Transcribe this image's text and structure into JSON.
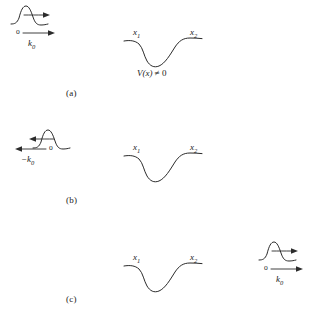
{
  "figure": {
    "background_color": "#ffffff",
    "ink_color": "#2b2b2b",
    "panels": [
      {
        "id": "a",
        "label": "(a)",
        "packet": {
          "name": "wave-packet-incoming",
          "direction": "right",
          "origin_label": "o",
          "momentum_label": "k",
          "momentum_sub": "0"
        },
        "well": {
          "name": "potential-well",
          "left_label": "x",
          "left_sub": "1",
          "right_label": "x",
          "right_sub": "2",
          "caption": "V(x) ≠ 0",
          "caption_fn": "V",
          "caption_arg": "(x)",
          "caption_rel": "≠ 0"
        }
      },
      {
        "id": "b",
        "label": "(b)",
        "packet": {
          "name": "wave-packet-reflected",
          "direction": "left",
          "origin_label": "o",
          "momentum_label": "−k",
          "momentum_sub": "0"
        },
        "well": {
          "name": "potential-well",
          "left_label": "x",
          "left_sub": "1",
          "right_label": "x",
          "right_sub": "2",
          "caption": "",
          "caption_fn": "",
          "caption_arg": "",
          "caption_rel": ""
        }
      },
      {
        "id": "c",
        "label": "(c)",
        "packet": {
          "name": "wave-packet-transmitted",
          "direction": "right",
          "origin_label": "o",
          "momentum_label": "k",
          "momentum_sub": "0"
        },
        "well": {
          "name": "potential-well",
          "left_label": "x",
          "left_sub": "1",
          "right_label": "x",
          "right_sub": "2",
          "caption": "",
          "caption_fn": "",
          "caption_arg": "",
          "caption_rel": ""
        }
      }
    ]
  }
}
